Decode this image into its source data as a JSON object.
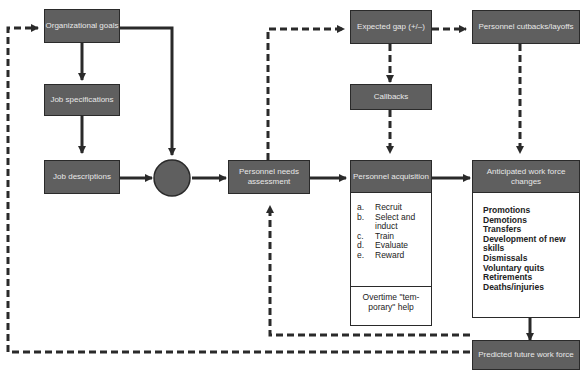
{
  "nodes": {
    "org_goals": "Organizational goals",
    "job_specs": "Job specifications",
    "job_desc": "Job descriptions",
    "needs": "Personnel needs assessment",
    "gap": "Expected gap (+/–)",
    "cutbacks": "Personnel cutbacks/layoffs",
    "callbacks": "Callbacks",
    "acquisition": "Personnel acquisition",
    "anticipated": "Anticipated work force changes",
    "predicted": "Predicted future work force"
  },
  "acquisition_steps": [
    {
      "k": "a.",
      "v": "Recruit"
    },
    {
      "k": "b.",
      "v": "Select and"
    },
    {
      "k": "",
      "v": "induct"
    },
    {
      "k": "c.",
      "v": "Train"
    },
    {
      "k": "d.",
      "v": "Evaluate"
    },
    {
      "k": "e.",
      "v": "Reward"
    }
  ],
  "overtime": "Overtime \"tem-porary\" help",
  "changes": [
    "Promotions",
    "Demotions",
    "Transfers",
    "Development of new skills",
    "Dismissals",
    "Voluntary quits",
    "Retirements",
    "Deaths/injuries"
  ]
}
